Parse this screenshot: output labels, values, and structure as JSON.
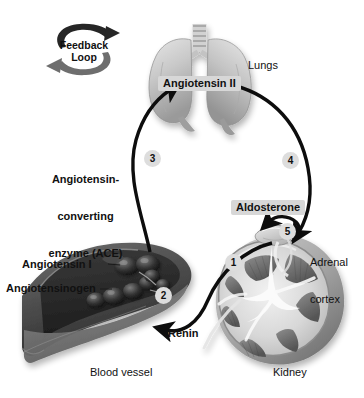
{
  "diagram": {
    "background_color": "#ffffff",
    "style": "grayscale medical illustration"
  },
  "feedback_loop": {
    "line1": "Feedback",
    "line2": "Loop",
    "icon": "circular-arrows-icon"
  },
  "labels": {
    "angiotensin_ii": "Angiotensin II",
    "lungs": "Lungs",
    "ace_line1": "Angiotensin-",
    "ace_line2": "converting",
    "ace_line3": "enzyme (ACE)",
    "aldosterone": "Aldosterone",
    "adrenal_line1": "Adrenal",
    "adrenal_line2": "cortex",
    "angiotensin_i": "Angiotensin I",
    "angiotensinogen": "Angiotensinogen",
    "renin": "Renin",
    "blood_vessel": "Blood vessel",
    "kidney": "Kidney"
  },
  "steps": [
    {
      "number": "1",
      "description": "Kidney releases renin"
    },
    {
      "number": "2",
      "description": "Renin converts angiotensinogen to angiotensin I"
    },
    {
      "number": "3",
      "description": "ACE converts angiotensin I to angiotensin II in lungs"
    },
    {
      "number": "4",
      "description": "Angiotensin II stimulates adrenal cortex"
    },
    {
      "number": "5",
      "description": "Adrenal cortex releases aldosterone"
    }
  ],
  "colors": {
    "label_box": "#d7d7d7",
    "step_circle": "#dddddd",
    "text": "#111111",
    "arrow": "#0d0d0d",
    "vessel_dark": "#4a4a4a",
    "organ_light": "#c8c8c8"
  }
}
